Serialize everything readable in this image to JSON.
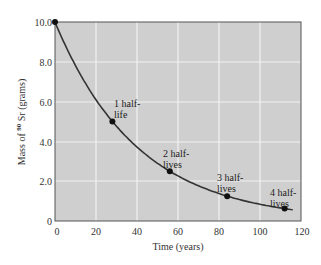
{
  "chart_data": {
    "type": "line",
    "title": "",
    "xlabel": "Time (years)",
    "ylabel": "Mass of 90Sr (grams)",
    "ylabel_prefix": "Mass of ",
    "ylabel_sup": "90",
    "ylabel_suffix": " Sr (grams)",
    "xlim": [
      0,
      120
    ],
    "ylim": [
      0,
      10.0
    ],
    "x_ticks": [
      "0",
      "20",
      "40",
      "60",
      "80",
      "100",
      "120"
    ],
    "y_ticks": [
      "0",
      "2.0",
      "4.0",
      "6.0",
      "8.0",
      "10.0"
    ],
    "grid": true,
    "half_life_years": 28,
    "series": [
      {
        "name": "Mass of 90Sr",
        "x": [
          0,
          28,
          56,
          84,
          112,
          116
        ],
        "values": [
          10.0,
          5.0,
          2.5,
          1.25,
          0.625,
          0.56
        ]
      }
    ],
    "points": [
      {
        "x": 0,
        "y": 10.0,
        "label": ""
      },
      {
        "x": 28,
        "y": 5.0,
        "label_line1": "1 half-",
        "label_line2": "life"
      },
      {
        "x": 56,
        "y": 2.5,
        "label_line1": "2 half-",
        "label_line2": "lives"
      },
      {
        "x": 84,
        "y": 1.25,
        "label_line1": "3 half-",
        "label_line2": "lives"
      },
      {
        "x": 112,
        "y": 0.625,
        "label_line1": "4 half-",
        "label_line2": "lives"
      }
    ],
    "colors": {
      "plot_background": "#cfcfcf",
      "grid": "#f2f2f2",
      "curve": "#333333",
      "points": "#111111"
    }
  }
}
